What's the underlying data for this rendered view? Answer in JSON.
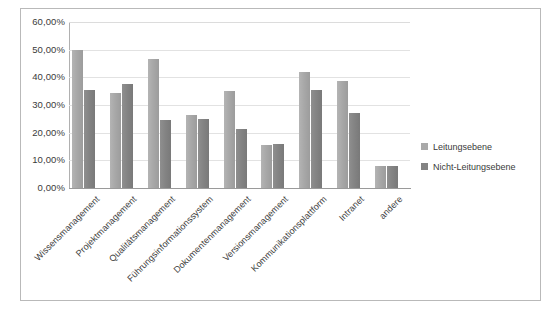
{
  "chart_data": {
    "type": "bar",
    "title": "",
    "subtitle": "",
    "xlabel": "",
    "ylabel": "",
    "ylim": [
      0,
      60
    ],
    "grid": true,
    "legend_position": "right",
    "y_tick_labels": [
      "60,00%",
      "50,00%",
      "40,00%",
      "30,00%",
      "20,00%",
      "10,00%",
      "0,00%"
    ],
    "y_tick_values": [
      60,
      50,
      40,
      30,
      20,
      10,
      0
    ],
    "categories": [
      "Wissensmanagement",
      "Projektmanagement",
      "Qualitätsmanagement",
      "Führungsinformationssystem",
      "Dokumentenmanagement",
      "Versionsmanagement",
      "Kommunikationsplattform",
      "Intranet",
      "andere"
    ],
    "series": [
      {
        "name": "Leitungsebene",
        "color": "#a9a9a9",
        "values": [
          50.0,
          34.5,
          46.5,
          26.5,
          35.0,
          15.5,
          42.0,
          38.5,
          8.0
        ]
      },
      {
        "name": "Nicht-Leitungsebene",
        "color": "#838383",
        "values": [
          35.5,
          37.5,
          24.5,
          25.0,
          21.5,
          16.0,
          35.5,
          27.0,
          8.0
        ]
      }
    ]
  },
  "legend": {
    "items": [
      {
        "label": "Leitungsebene"
      },
      {
        "label": "Nicht-Leitungsebene"
      }
    ]
  },
  "colors": {
    "series_light": "#a9a9a9",
    "series_dark": "#838383",
    "gridline": "#e2e2e2",
    "axis": "#9a9a9a",
    "border": "#b9b9b9",
    "text": "#3a3a3a",
    "background": "#ffffff"
  }
}
